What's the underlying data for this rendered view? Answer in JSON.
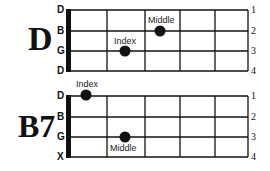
{
  "chords": [
    {
      "name": "D",
      "strings": [
        "D",
        "B",
        "G",
        "D"
      ],
      "fret_numbers": [
        "1",
        "2",
        "3",
        "4"
      ],
      "fingers": [
        {
          "label": "Index",
          "string": "G",
          "fret": 1
        },
        {
          "label": "Middle",
          "string": "B",
          "fret": 2
        }
      ]
    },
    {
      "name": "B7",
      "strings": [
        "D",
        "B",
        "G",
        "X"
      ],
      "fret_numbers": [
        "1",
        "2",
        "3",
        "4"
      ],
      "fingers": [
        {
          "label": "Index",
          "string": "D",
          "fret": 0
        },
        {
          "label": "Middle",
          "string": "G",
          "fret": 1
        }
      ]
    }
  ],
  "colors": {
    "ink": "#111111",
    "background": "#ffffff"
  }
}
